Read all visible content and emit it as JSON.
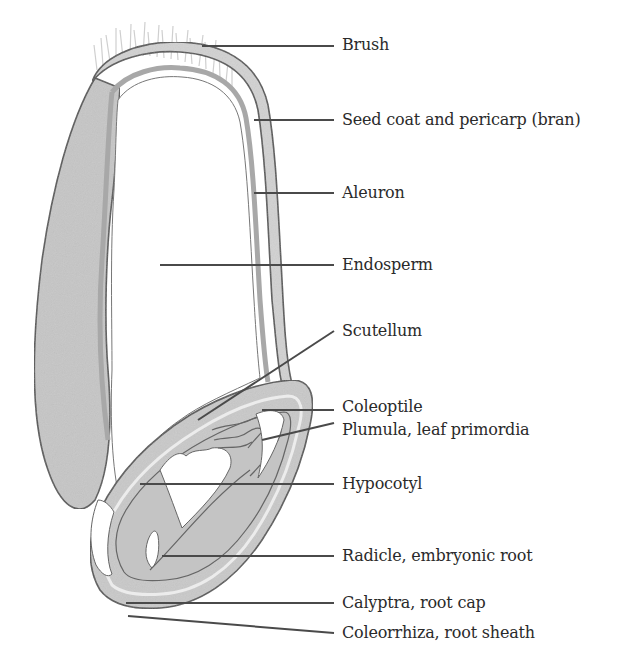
{
  "diagram": {
    "colors": {
      "outline": "#555555",
      "fill": "#c8c8c8",
      "aleuron": "#a8a8a8",
      "background": "#ffffff",
      "leader": "#4a4a4a",
      "text": "#2a2a2a"
    },
    "labels": [
      {
        "id": "brush",
        "text": "Brush"
      },
      {
        "id": "seed-coat",
        "text": "Seed coat and pericarp (bran)"
      },
      {
        "id": "aleuron",
        "text": "Aleuron"
      },
      {
        "id": "endosperm",
        "text": "Endosperm"
      },
      {
        "id": "scutellum",
        "text": "Scutellum"
      },
      {
        "id": "coleoptile",
        "text": "Coleoptile"
      },
      {
        "id": "plumula",
        "text": "Plumula, leaf primordia"
      },
      {
        "id": "hypocotyl",
        "text": "Hypocotyl"
      },
      {
        "id": "radicle",
        "text": "Radicle, embryonic root"
      },
      {
        "id": "calyptra",
        "text": "Calyptra, root cap"
      },
      {
        "id": "coleorrhiza",
        "text": "Coleorrhiza, root sheath"
      }
    ]
  }
}
